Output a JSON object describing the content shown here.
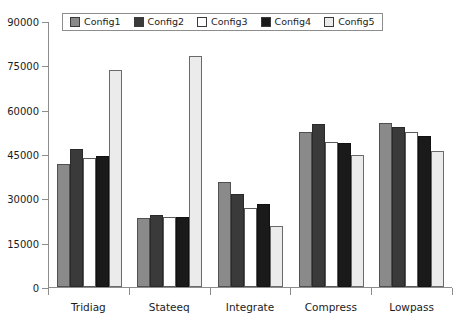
{
  "chart_data": {
    "type": "bar",
    "title": "",
    "xlabel": "",
    "ylabel": "",
    "ylim": [
      0,
      90000
    ],
    "yticks": [
      0,
      15000,
      30000,
      45000,
      60000,
      75000,
      90000
    ],
    "ytick_labels": [
      "0",
      "15000",
      "30000",
      "45000",
      "60000",
      "75000",
      "90000"
    ],
    "grid": false,
    "legend_position": "top",
    "categories": [
      "Tridiag",
      "Stateeq",
      "Integrate",
      "Compress",
      "Lowpass"
    ],
    "series": [
      {
        "name": "Config1",
        "color": "#8a8a8a",
        "values": [
          41500,
          23200,
          35500,
          52500,
          55500
        ]
      },
      {
        "name": "Config2",
        "color": "#3a3a3a",
        "values": [
          46800,
          24200,
          31500,
          55000,
          54000
        ]
      },
      {
        "name": "Config3",
        "color": "#ffffff",
        "values": [
          43700,
          23600,
          26800,
          49000,
          52500
        ]
      },
      {
        "name": "Config4",
        "color": "#1a1a1a",
        "values": [
          44200,
          23600,
          28000,
          48700,
          51000
        ]
      },
      {
        "name": "Config5",
        "color": "#ebebeb",
        "values": [
          73500,
          78000,
          20800,
          44800,
          46000
        ]
      }
    ]
  }
}
